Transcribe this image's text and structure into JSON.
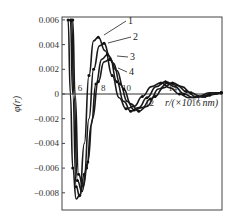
{
  "chart_data": {
    "type": "line",
    "title": "",
    "xlabel": "r/(×10⁻¹ nm)",
    "ylabel": "φ(r)",
    "xlim": [
      4.3,
      18
    ],
    "ylim": [
      -0.0095,
      0.006
    ],
    "grid": false,
    "legend_position": "inline labels with leader lines",
    "y_ticks": [
      0.006,
      0.004,
      0.002,
      0,
      -0.002,
      -0.004,
      -0.006,
      -0.008
    ],
    "y_tick_labels": [
      "0.006",
      "0.004",
      "0.002",
      "0",
      "−0.002",
      "−0.004",
      "−0.006",
      "−0.008"
    ],
    "x_ticks": [
      6,
      8,
      10,
      12,
      14,
      16
    ],
    "x_tick_labels": [
      "6",
      "8",
      "10",
      "12",
      "14",
      "16"
    ],
    "series": [
      {
        "name": "1",
        "x": [
          4.8,
          5.0,
          5.2,
          5.5,
          5.8,
          6.2,
          6.6,
          7.0,
          7.4,
          8.0,
          8.6,
          9.2,
          9.8,
          10.5,
          11.2,
          12.0,
          12.8,
          13.6,
          14.4,
          15.2,
          16.0,
          17.0,
          18.0
        ],
        "values": [
          0.006,
          0.0,
          -0.006,
          -0.0085,
          -0.0082,
          -0.004,
          0.0015,
          0.0043,
          0.0046,
          0.0035,
          0.0015,
          -0.0003,
          -0.0012,
          -0.001,
          -0.0002,
          0.0006,
          0.0009,
          0.0005,
          0.0,
          -0.0003,
          -0.0002,
          0.0001,
          0.0001
        ]
      },
      {
        "name": "2",
        "x": [
          5.0,
          5.2,
          5.5,
          5.8,
          6.2,
          6.6,
          7.0,
          7.5,
          7.9,
          8.4,
          9.0,
          9.6,
          10.2,
          10.9,
          11.6,
          12.4,
          13.2,
          14.0,
          14.8,
          15.6,
          16.4,
          17.2,
          18.0
        ],
        "values": [
          0.006,
          0.0,
          -0.0075,
          -0.0083,
          -0.0065,
          -0.002,
          0.002,
          0.0039,
          0.0041,
          0.003,
          0.001,
          -0.0006,
          -0.0014,
          -0.0011,
          -0.0003,
          0.0006,
          0.001,
          0.0006,
          0.0,
          -0.0003,
          -0.0002,
          0.0001,
          0.0001
        ]
      },
      {
        "name": "3",
        "x": [
          5.1,
          5.3,
          5.6,
          6.0,
          6.4,
          6.8,
          7.2,
          7.7,
          8.2,
          8.7,
          9.3,
          9.9,
          10.5,
          11.2,
          11.9,
          12.6,
          13.4,
          14.2,
          15.0,
          15.8,
          16.6,
          17.4,
          18.0
        ],
        "values": [
          0.006,
          0.0,
          -0.007,
          -0.0079,
          -0.006,
          -0.0025,
          0.0008,
          0.0028,
          0.0032,
          0.0025,
          0.0008,
          -0.0006,
          -0.0013,
          -0.0011,
          -0.0004,
          0.0004,
          0.0009,
          0.0007,
          0.0002,
          -0.0002,
          -0.0002,
          0.0,
          0.0001
        ]
      },
      {
        "name": "4",
        "x": [
          5.2,
          5.4,
          5.7,
          6.1,
          6.5,
          6.9,
          7.4,
          7.9,
          8.4,
          9.0,
          9.6,
          10.2,
          10.9,
          11.6,
          12.3,
          13.0,
          13.8,
          14.6,
          15.4,
          16.2,
          17.0,
          17.6,
          18.0
        ],
        "values": [
          0.006,
          0.0,
          -0.0065,
          -0.0075,
          -0.0055,
          -0.002,
          0.001,
          0.0026,
          0.0028,
          0.0019,
          0.0004,
          -0.0008,
          -0.0014,
          -0.001,
          -0.0002,
          0.0005,
          0.0009,
          0.0006,
          0.0001,
          -0.0002,
          -0.0001,
          0.0,
          0.0001
        ]
      }
    ],
    "annotations": [
      "1",
      "2",
      "3",
      "4"
    ]
  },
  "axes": {
    "ylabel": "φ(r)",
    "xlabel_main": "r/(×10",
    "xlabel_exp": "−1",
    "xlabel_unit": " nm)"
  }
}
